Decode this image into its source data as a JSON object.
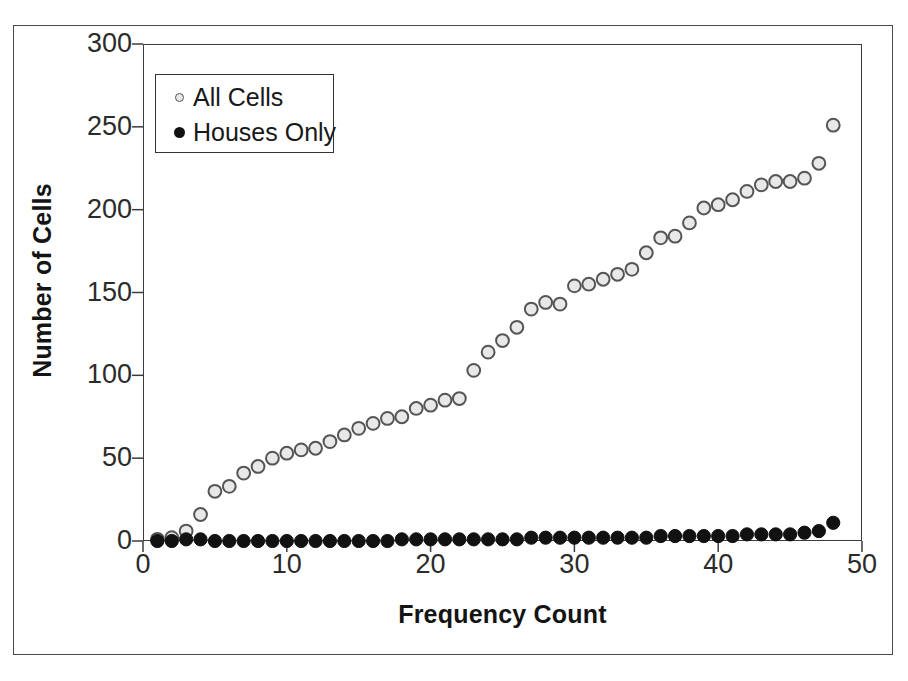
{
  "chart_data": {
    "type": "scatter",
    "title": "",
    "xlabel": "Frequency Count",
    "ylabel": "Number of Cells",
    "xlim": [
      0,
      50
    ],
    "ylim": [
      0,
      300
    ],
    "xticks": [
      0,
      10,
      20,
      30,
      40,
      50
    ],
    "yticks": [
      0,
      50,
      100,
      150,
      200,
      250,
      300
    ],
    "grid": false,
    "legend_position": "top-left",
    "x": [
      1,
      2,
      3,
      4,
      5,
      6,
      7,
      8,
      9,
      10,
      11,
      12,
      13,
      14,
      15,
      16,
      17,
      18,
      19,
      20,
      21,
      22,
      23,
      24,
      25,
      26,
      27,
      28,
      29,
      30,
      31,
      32,
      33,
      34,
      35,
      36,
      37,
      38,
      39,
      40,
      41,
      42,
      43,
      44,
      45,
      46,
      47,
      48
    ],
    "series": [
      {
        "name": "All Cells",
        "marker": "open-circle",
        "color": "#e8e8e8",
        "edge_color": "#555555",
        "values": [
          1,
          2,
          6,
          16,
          30,
          33,
          41,
          45,
          50,
          53,
          55,
          56,
          60,
          64,
          68,
          71,
          74,
          75,
          80,
          82,
          85,
          86,
          103,
          114,
          121,
          129,
          140,
          144,
          143,
          154,
          155,
          158,
          161,
          164,
          174,
          183,
          184,
          192,
          201,
          203,
          206,
          211,
          215,
          217,
          217,
          219,
          228,
          251
        ]
      },
      {
        "name": "Houses Only",
        "marker": "filled-circle",
        "color": "#111111",
        "edge_color": "#111111",
        "values": [
          0,
          0,
          1,
          1,
          0,
          0,
          0,
          0,
          0,
          0,
          0,
          0,
          0,
          0,
          0,
          0,
          0,
          1,
          1,
          1,
          1,
          1,
          1,
          1,
          1,
          1,
          2,
          2,
          2,
          2,
          2,
          2,
          2,
          2,
          2,
          3,
          3,
          3,
          3,
          3,
          3,
          4,
          4,
          4,
          4,
          5,
          6,
          11
        ]
      }
    ]
  },
  "legend": {
    "entries": [
      {
        "label": "All Cells"
      },
      {
        "label": "Houses Only"
      }
    ]
  }
}
